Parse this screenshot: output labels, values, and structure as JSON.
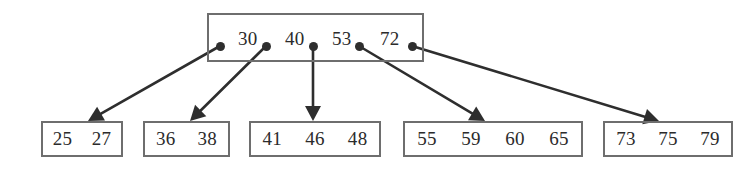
{
  "figure": {
    "kind": "b-tree-diagram",
    "levels": 2,
    "line_color": "#2e2e2e",
    "box_border_color": "#6e6e6e",
    "text_color": "#2b2b2b",
    "background": "#ffffff"
  },
  "root": {
    "name": "root-node",
    "keys": [
      "30",
      "40",
      "53",
      "72"
    ],
    "box": {
      "x": 207,
      "y": 13,
      "w": 217,
      "h": 49
    },
    "key_positions": [
      236,
      283,
      330,
      378
    ],
    "pointer_dots": [
      {
        "x": 220,
        "y": 46
      },
      {
        "x": 266,
        "y": 46
      },
      {
        "x": 313,
        "y": 46
      },
      {
        "x": 359,
        "y": 46
      },
      {
        "x": 412,
        "y": 46
      }
    ]
  },
  "leaves": [
    {
      "name": "leaf-node-1",
      "keys": [
        "25",
        "27"
      ],
      "box": {
        "x": 41,
        "y": 121,
        "w": 82,
        "h": 36
      },
      "arrow_tip": {
        "x": 88,
        "y": 121
      }
    },
    {
      "name": "leaf-node-2",
      "keys": [
        "36",
        "38"
      ],
      "box": {
        "x": 143,
        "y": 121,
        "w": 87,
        "h": 36
      },
      "arrow_tip": {
        "x": 190,
        "y": 121
      }
    },
    {
      "name": "leaf-node-3",
      "keys": [
        "41",
        "46",
        "48"
      ],
      "box": {
        "x": 249,
        "y": 121,
        "w": 132,
        "h": 36
      },
      "arrow_tip": {
        "x": 313,
        "y": 121
      }
    },
    {
      "name": "leaf-node-4",
      "keys": [
        "55",
        "59",
        "60",
        "65"
      ],
      "box": {
        "x": 403,
        "y": 121,
        "w": 180,
        "h": 36
      },
      "arrow_tip": {
        "x": 485,
        "y": 121
      }
    },
    {
      "name": "leaf-node-5",
      "keys": [
        "73",
        "75",
        "79"
      ],
      "box": {
        "x": 603,
        "y": 121,
        "w": 130,
        "h": 36
      },
      "arrow_tip": {
        "x": 659,
        "y": 121
      }
    }
  ],
  "edges": [
    {
      "name": "edge-root-to-leaf-1",
      "from": [
        220,
        46
      ],
      "to": [
        88,
        121
      ]
    },
    {
      "name": "edge-root-to-leaf-2",
      "from": [
        266,
        46
      ],
      "to": [
        190,
        121
      ]
    },
    {
      "name": "edge-root-to-leaf-3",
      "from": [
        313,
        46
      ],
      "to": [
        313,
        121
      ]
    },
    {
      "name": "edge-root-to-leaf-4",
      "from": [
        359,
        46
      ],
      "to": [
        485,
        121
      ]
    },
    {
      "name": "edge-root-to-leaf-5",
      "from": [
        412,
        46
      ],
      "to": [
        659,
        121
      ]
    }
  ]
}
